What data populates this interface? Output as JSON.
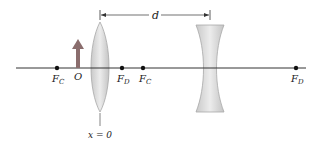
{
  "diagram": {
    "type": "optics-two-lens-system",
    "axis_label": "optical axis",
    "object": {
      "label": "O",
      "kind": "upright-arrow",
      "color": "#8a6d6d"
    },
    "lens_converging": {
      "label": "converging lens",
      "position_label": "x = 0"
    },
    "lens_diverging": {
      "label": "diverging lens"
    },
    "separation": {
      "label": "d"
    },
    "focal_points": [
      {
        "main": "F",
        "sub": "C",
        "side": "left of converging lens"
      },
      {
        "main": "F",
        "sub": "D",
        "side": "right of converging lens"
      },
      {
        "main": "F",
        "sub": "C",
        "side": "right of converging lens"
      },
      {
        "main": "F",
        "sub": "D",
        "side": "far right"
      }
    ],
    "colors": {
      "axis": "#333333",
      "lens_fill": "#d9d9d9",
      "lens_stroke": "#a8a8a8",
      "object_arrow": "#8a6d6d",
      "dot": "#111111"
    }
  }
}
